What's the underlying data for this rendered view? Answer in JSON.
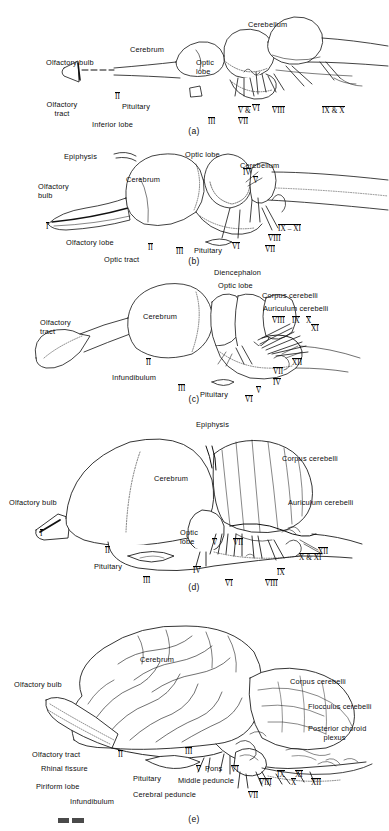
{
  "figure": {
    "panels": [
      {
        "id": "a",
        "caption": "(a)",
        "labels": [
          {
            "text": "Olfactory bulb",
            "x": 46,
            "y": 58,
            "align": "left"
          },
          {
            "text": "Olfactory\ntract",
            "x": 62,
            "y": 100,
            "align": "center"
          },
          {
            "text": "Cerebrum",
            "x": 130,
            "y": 45,
            "align": "left"
          },
          {
            "text": "Optic\nlobe",
            "x": 196,
            "y": 58,
            "align": "left"
          },
          {
            "text": "Cerebellum",
            "x": 248,
            "y": 20,
            "align": "left"
          },
          {
            "text": "Pituitary",
            "x": 122,
            "y": 102,
            "align": "left"
          },
          {
            "text": "Inferior lobe",
            "x": 92,
            "y": 120,
            "align": "left"
          }
        ],
        "numerals": [
          {
            "text": "II",
            "x": 115,
            "y": 92
          },
          {
            "text": "III",
            "x": 208,
            "y": 117
          },
          {
            "text": "V &",
            "x": 238,
            "y": 106
          },
          {
            "text": "VII",
            "x": 238,
            "y": 117
          },
          {
            "text": "VI",
            "x": 252,
            "y": 104
          },
          {
            "text": "VIII",
            "x": 272,
            "y": 106
          },
          {
            "text": "IX & X",
            "x": 322,
            "y": 106
          }
        ]
      },
      {
        "id": "b",
        "caption": "(b)",
        "labels": [
          {
            "text": "Epiphysis",
            "x": 64,
            "y": 14,
            "align": "left"
          },
          {
            "text": "Olfactory\nbulb",
            "x": 38,
            "y": 44,
            "align": "left"
          },
          {
            "text": "Cerebrum",
            "x": 126,
            "y": 37,
            "align": "left"
          },
          {
            "text": "Optic lobe",
            "x": 185,
            "y": 12,
            "align": "left"
          },
          {
            "text": "Cerebellum",
            "x": 240,
            "y": 23,
            "align": "left"
          },
          {
            "text": "Olfactory lobe",
            "x": 66,
            "y": 100,
            "align": "left"
          },
          {
            "text": "Optic tract",
            "x": 104,
            "y": 117,
            "align": "left"
          },
          {
            "text": "Pituitary",
            "x": 194,
            "y": 108,
            "align": "left"
          }
        ],
        "numerals": [
          {
            "text": "I",
            "x": 46,
            "y": 84
          },
          {
            "text": "II",
            "x": 148,
            "y": 105
          },
          {
            "text": "III",
            "x": 176,
            "y": 109
          },
          {
            "text": "IV",
            "x": 243,
            "y": 30
          },
          {
            "text": "V",
            "x": 253,
            "y": 38
          },
          {
            "text": "VI",
            "x": 232,
            "y": 104
          },
          {
            "text": "VII",
            "x": 265,
            "y": 107
          },
          {
            "text": "VIII",
            "x": 268,
            "y": 96
          },
          {
            "text": "IX – XI",
            "x": 278,
            "y": 86
          }
        ]
      },
      {
        "id": "c",
        "caption": "(c)",
        "labels": [
          {
            "text": "Diencephalon",
            "x": 214,
            "y": 2,
            "align": "left"
          },
          {
            "text": "Optic lobe",
            "x": 218,
            "y": 15,
            "align": "left"
          },
          {
            "text": "Corpus cerebelli",
            "x": 262,
            "y": 25,
            "align": "left"
          },
          {
            "text": "Auriculum cerebelli",
            "x": 263,
            "y": 38,
            "align": "left"
          },
          {
            "text": "Olfactory\ntract",
            "x": 40,
            "y": 52,
            "align": "left"
          },
          {
            "text": "Cerebrum",
            "x": 143,
            "y": 46,
            "align": "left"
          },
          {
            "text": "Infundibulum",
            "x": 112,
            "y": 107,
            "align": "left"
          },
          {
            "text": "Pituitary",
            "x": 200,
            "y": 124,
            "align": "left"
          }
        ],
        "numerals": [
          {
            "text": "II",
            "x": 146,
            "y": 92
          },
          {
            "text": "III",
            "x": 178,
            "y": 118
          },
          {
            "text": "IV",
            "x": 273,
            "y": 112
          },
          {
            "text": "V",
            "x": 256,
            "y": 120
          },
          {
            "text": "VI",
            "x": 245,
            "y": 129
          },
          {
            "text": "VII",
            "x": 273,
            "y": 101
          },
          {
            "text": "VIII",
            "x": 272,
            "y": 50
          },
          {
            "text": "IX",
            "x": 292,
            "y": 50
          },
          {
            "text": "X",
            "x": 306,
            "y": 50
          },
          {
            "text": "XI",
            "x": 311,
            "y": 58
          },
          {
            "text": "XII",
            "x": 292,
            "y": 92
          }
        ]
      },
      {
        "id": "d",
        "caption": "(d)",
        "labels": [
          {
            "text": "Epiphysis",
            "x": 196,
            "y": 14,
            "align": "left"
          },
          {
            "text": "Corpus cerebelli",
            "x": 282,
            "y": 48,
            "align": "left"
          },
          {
            "text": "Cerebrum",
            "x": 154,
            "y": 68,
            "align": "left"
          },
          {
            "text": "Auriculum cerebelli",
            "x": 288,
            "y": 92,
            "align": "left"
          },
          {
            "text": "Olfactory bulb",
            "x": 9,
            "y": 92,
            "align": "left"
          },
          {
            "text": "Optic\nlobe",
            "x": 180,
            "y": 122,
            "align": "left"
          },
          {
            "text": "Pituitary",
            "x": 94,
            "y": 156,
            "align": "left"
          }
        ],
        "numerals": [
          {
            "text": "I",
            "x": 40,
            "y": 123
          },
          {
            "text": "II",
            "x": 105,
            "y": 140
          },
          {
            "text": "III",
            "x": 143,
            "y": 170
          },
          {
            "text": "IV",
            "x": 193,
            "y": 160
          },
          {
            "text": "V",
            "x": 212,
            "y": 132
          },
          {
            "text": "VI",
            "x": 225,
            "y": 173
          },
          {
            "text": "VII",
            "x": 233,
            "y": 132
          },
          {
            "text": "VIII",
            "x": 265,
            "y": 173
          },
          {
            "text": "IX",
            "x": 277,
            "y": 162
          },
          {
            "text": "X & XI",
            "x": 299,
            "y": 147
          },
          {
            "text": "XII",
            "x": 318,
            "y": 141
          }
        ]
      },
      {
        "id": "e",
        "caption": "(e)",
        "labels": [
          {
            "text": "Cerebrum",
            "x": 140,
            "y": 63,
            "align": "left"
          },
          {
            "text": "Corpus cerebelli",
            "x": 290,
            "y": 85,
            "align": "left"
          },
          {
            "text": "Flocculus cerebelli",
            "x": 308,
            "y": 110,
            "align": "left"
          },
          {
            "text": "Olfactory bulb",
            "x": 14,
            "y": 88,
            "align": "left"
          },
          {
            "text": "Posterior choroid\n       plexus",
            "x": 308,
            "y": 132,
            "align": "left"
          },
          {
            "text": "Olfactory tract",
            "x": 32,
            "y": 158,
            "align": "left"
          },
          {
            "text": "Rhinal fissure",
            "x": 41,
            "y": 172,
            "align": "left"
          },
          {
            "text": "Piriform lobe",
            "x": 36,
            "y": 190,
            "align": "left"
          },
          {
            "text": "Infundibulum",
            "x": 70,
            "y": 205,
            "align": "left"
          },
          {
            "text": "Pituitary",
            "x": 133,
            "y": 182,
            "align": "left"
          },
          {
            "text": "Cerebral peduncle",
            "x": 133,
            "y": 198,
            "align": "left"
          },
          {
            "text": "Middle peduncle",
            "x": 178,
            "y": 184,
            "align": "left"
          },
          {
            "text": "Pons",
            "x": 205,
            "y": 172,
            "align": "left"
          }
        ],
        "numerals": [
          {
            "text": "II",
            "x": 118,
            "y": 158
          },
          {
            "text": "III",
            "x": 185,
            "y": 155
          },
          {
            "text": "V",
            "x": 196,
            "y": 173
          },
          {
            "text": "VI",
            "x": 231,
            "y": 173
          },
          {
            "text": "VII",
            "x": 248,
            "y": 199
          },
          {
            "text": "VIII",
            "x": 259,
            "y": 186
          },
          {
            "text": "IX",
            "x": 277,
            "y": 178
          },
          {
            "text": "X",
            "x": 291,
            "y": 186
          },
          {
            "text": "XI",
            "x": 295,
            "y": 178
          },
          {
            "text": "XII",
            "x": 311,
            "y": 186
          }
        ]
      }
    ]
  }
}
